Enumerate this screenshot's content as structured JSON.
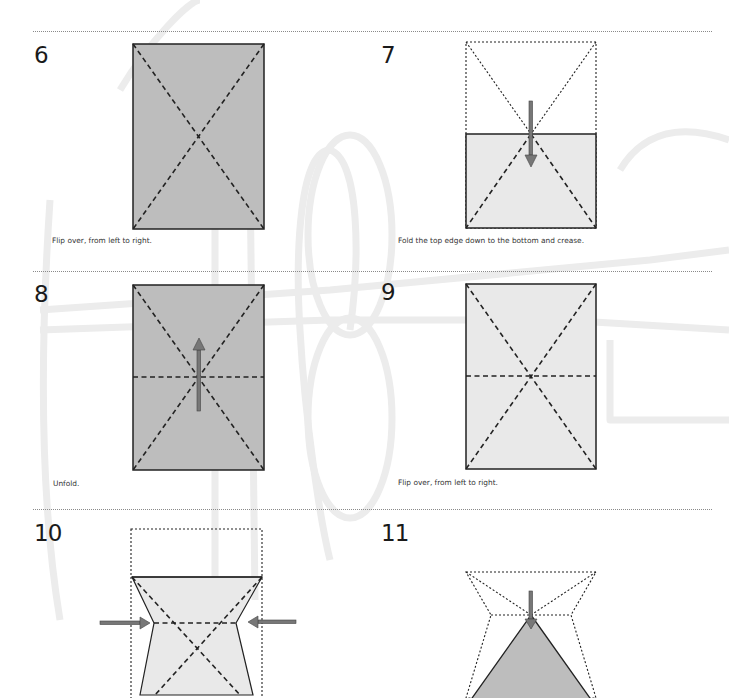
{
  "colors": {
    "paper_dark": "#bdbdbd",
    "paper_light": "#e9e9e9",
    "line": "#222222",
    "arrow": "#777777",
    "divider": "#8a8a8a",
    "watermark": "#ececec"
  },
  "steps": [
    {
      "number": "6",
      "caption": "Flip over, from left to right."
    },
    {
      "number": "7",
      "caption": "Fold the top edge down to the bottom and crease."
    },
    {
      "number": "8",
      "caption": "Unfold."
    },
    {
      "number": "9",
      "caption": "Flip over, from left to right."
    },
    {
      "number": "10",
      "caption": ""
    },
    {
      "number": "11",
      "caption": ""
    }
  ]
}
